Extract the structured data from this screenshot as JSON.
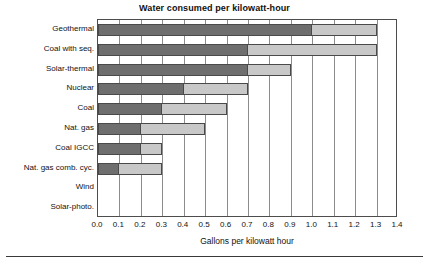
{
  "chart_data": {
    "type": "bar",
    "orientation": "horizontal",
    "stacked": true,
    "title": "Water consumed per kilowatt-hour",
    "xlabel": "Gallons per kilowatt hour",
    "ylabel": "",
    "xlim": [
      0.0,
      1.4
    ],
    "xticks": [
      "0.0",
      "0.1",
      "0.2",
      "0.3",
      "0.4",
      "0.5",
      "0.6",
      "0.7",
      "0.8",
      "0.9",
      "1.0",
      "1.1",
      "1.2",
      "1.3",
      "1.4"
    ],
    "xtick_values": [
      0.0,
      0.1,
      0.2,
      0.3,
      0.4,
      0.5,
      0.6,
      0.7,
      0.8,
      0.9,
      1.0,
      1.1,
      1.2,
      1.3,
      1.4
    ],
    "grid": true,
    "legend": null,
    "categories": [
      "Geothermal",
      "Coal with seq.",
      "Solar-thermal",
      "Nuclear",
      "Coal",
      "Nat. gas",
      "Coal IGCC",
      "Nat. gas comb. cyc.",
      "Wind",
      "Solar-photo."
    ],
    "series": [
      {
        "name": "dark segment",
        "color": "#6e6e6e",
        "values": [
          1.0,
          0.7,
          0.7,
          0.4,
          0.3,
          0.2,
          0.2,
          0.1,
          0.0,
          0.0
        ]
      },
      {
        "name": "light segment",
        "color": "#c8c8c8",
        "values": [
          0.3,
          0.6,
          0.2,
          0.3,
          0.3,
          0.3,
          0.1,
          0.2,
          0.0,
          0.0
        ]
      }
    ],
    "totals": [
      1.3,
      1.3,
      0.9,
      0.7,
      0.6,
      0.5,
      0.3,
      0.3,
      0.0,
      0.0
    ]
  },
  "colors": {
    "dark_segment": "#6e6e6e",
    "light_segment": "#c8c8c8",
    "bar_outline": "#4a4a4a",
    "gridline": "#8c8c8c",
    "axis": "#4d4d4d",
    "text": "#111111",
    "background": "#ffffff"
  }
}
